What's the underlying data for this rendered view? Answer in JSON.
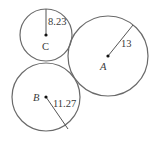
{
  "diagram": {
    "type": "tangent-circles",
    "stroke_color": "#6a6a6a",
    "text_color": "#3a3a3a",
    "circles": [
      {
        "id": "A",
        "label": "A",
        "radius_label": "13",
        "center": [
          108,
          56
        ],
        "r": 40,
        "radius_end": [
          133,
          25
        ],
        "label_pos": [
          100,
          70
        ],
        "radius_label_pos": [
          121,
          47
        ]
      },
      {
        "id": "B",
        "label": "B",
        "radius_label": "11.27",
        "center": [
          46,
          97
        ],
        "r": 34,
        "radius_end": [
          68,
          129
        ],
        "label_pos": [
          33,
          101
        ],
        "radius_label_pos": [
          53,
          107
        ]
      },
      {
        "id": "C",
        "label": "C",
        "radius_label": "8.23",
        "center": [
          46,
          35
        ],
        "r": 26,
        "radius_end": [
          46,
          9
        ],
        "label_pos": [
          42,
          50
        ],
        "radius_label_pos": [
          48,
          25
        ]
      }
    ]
  }
}
